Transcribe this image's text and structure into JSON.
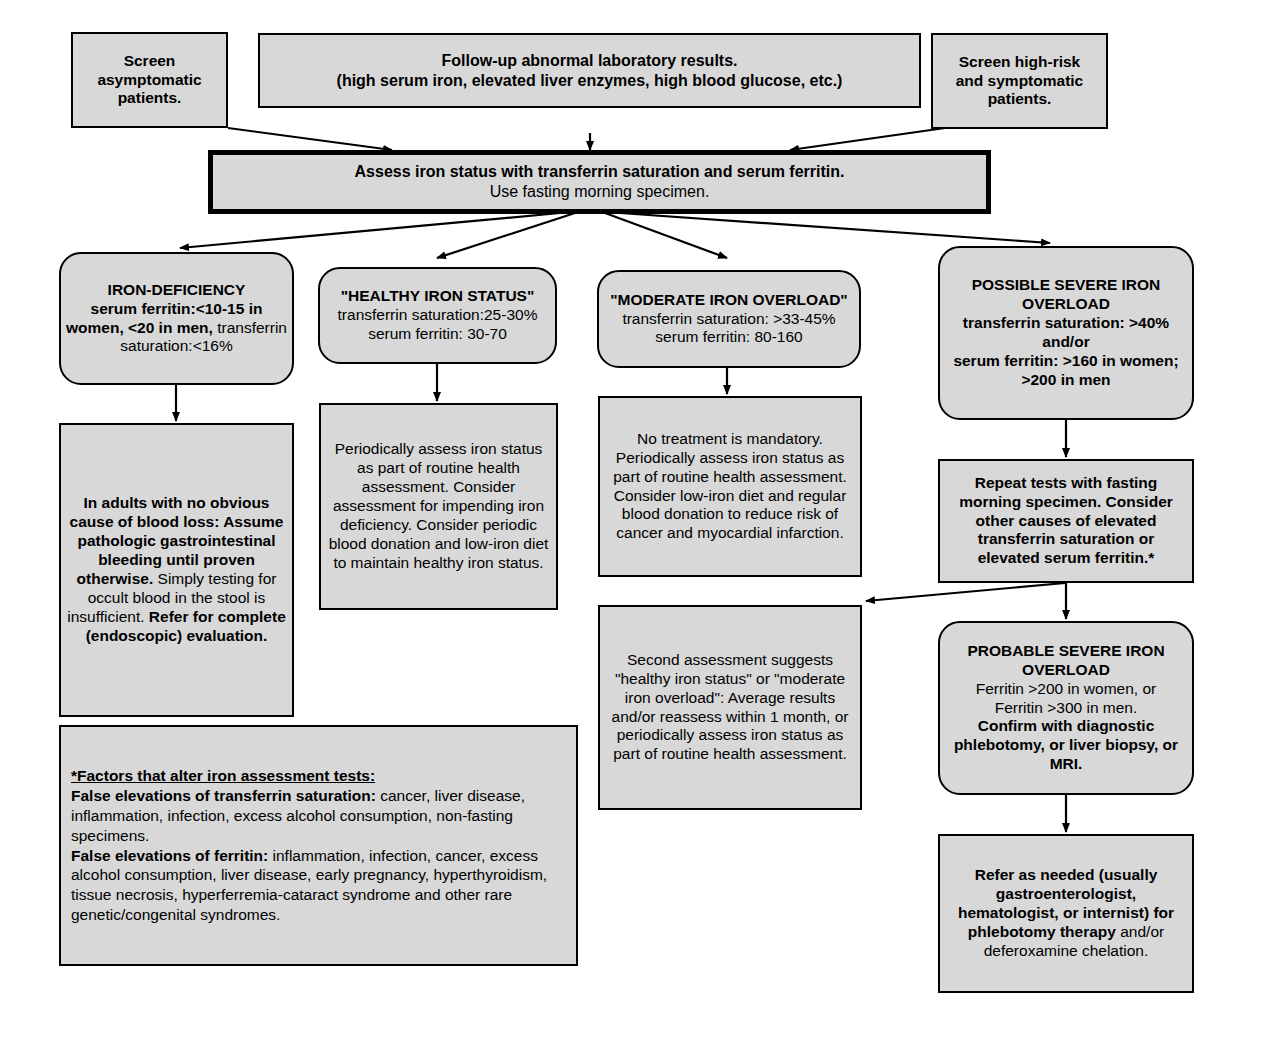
{
  "diagram": {
    "box_fill": "#d8d8d8",
    "line_color": "#000000",
    "background": "#ffffff"
  },
  "nodes": {
    "screen_asymptomatic": {
      "label": "Screen\nasymptomatic\npatients."
    },
    "followup_abnormal": {
      "line1": "Follow-up abnormal laboratory results.",
      "line2": "(high serum iron, elevated liver enzymes, high blood glucose, etc.)"
    },
    "screen_high_risk": {
      "label": "Screen high-risk\nand symptomatic\npatients."
    },
    "assess_iron_status": {
      "line1": "Assess iron status with transferrin saturation and serum ferritin.",
      "line2": "Use fasting morning specimen."
    },
    "iron_deficiency": {
      "heading": "IRON-DEFICIENCY",
      "bold_part": "serum ferritin:<10-15 in women, <20 in men,",
      "regular_part": " transferrin saturation:<16%"
    },
    "healthy_iron_status": {
      "heading": "\"HEALTHY IRON STATUS\"",
      "line2": "transferrin saturation:25-30%",
      "line3": "serum ferritin: 30-70"
    },
    "moderate_iron_overload": {
      "heading": "\"MODERATE IRON OVERLOAD\"",
      "line2": "transferrin saturation: >33-45%",
      "line3": "serum ferritin: 80-160"
    },
    "possible_severe_overload": {
      "heading": "POSSIBLE SEVERE IRON OVERLOAD",
      "line2": "transferrin saturation: >40%",
      "line3": "and/or",
      "line4": "serum ferritin: >160 in women; >200 in men"
    },
    "iron_deficiency_action": {
      "bold1": "In adults with no obvious cause of blood loss: Assume pathologic gastrointestinal bleeding until proven otherwise.",
      "regular1": " Simply testing for occult blood in the stool is insufficient. ",
      "bold2": "Refer for complete (endoscopic) evaluation."
    },
    "healthy_action": {
      "text": "Periodically assess iron status as part of routine health assessment. Consider assessment for impending iron deficiency. Consider periodic blood donation and low-iron diet to maintain healthy iron status."
    },
    "moderate_action": {
      "text": "No treatment is mandatory. Periodically assess iron status as part of routine health assessment.  Consider low-iron diet and regular blood donation to reduce risk of cancer and myocardial infarction."
    },
    "second_assessment": {
      "text": "Second assessment suggests \"healthy iron status\" or \"moderate iron overload\": Average results and/or reassess within 1 month, or periodically assess iron status as part of routine health assessment."
    },
    "repeat_tests": {
      "text": "Repeat tests with fasting morning specimen.  Consider other causes of elevated transferrin saturation or elevated serum ferritin.*"
    },
    "probable_severe_overload": {
      "heading": "PROBABLE SEVERE IRON OVERLOAD",
      "line2": "Ferritin >200 in women, or",
      "line3": "Ferritin >300 in men.",
      "bold_tail": "Confirm with diagnostic phlebotomy, or liver biopsy, or MRI."
    },
    "refer_as_needed": {
      "bold1": "Refer as needed (usually gastroenterologist, hematologist, or internist) for phlebotomy therapy",
      "regular1": " and/or deferoxamine chelation."
    },
    "footnote": {
      "heading": "*Factors that alter iron assessment tests:",
      "sub1_bold": "False elevations of transferrin saturation:",
      "sub1_text": " cancer, liver disease, inflammation, infection, excess alcohol consumption, non-fasting specimens.",
      "sub2_bold": "False elevations of ferritin:",
      "sub2_text": " inflammation, infection, cancer, excess alcohol consumption, liver disease, early pregnancy, hyperthyroidism, tissue necrosis, hyperferremia-cataract syndrome and other rare genetic/congenital syndromes."
    }
  }
}
